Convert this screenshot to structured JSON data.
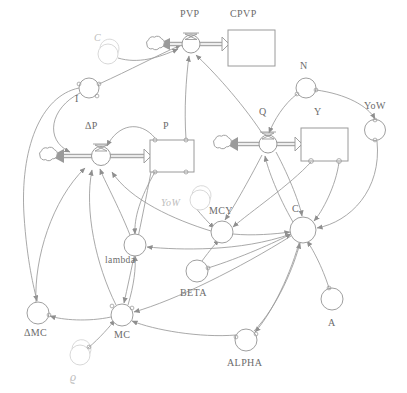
{
  "diagram": {
    "type": "system-dynamics-stock-and-flow",
    "title": "",
    "colors": {
      "line": "#9a9a9a",
      "line_dark": "#8a8a8a",
      "text": "#6b6b6b",
      "ghost": "#c9c9c9",
      "pipe": "#a0a0a0",
      "background": "#ffffff"
    },
    "stocks": [
      {
        "id": "CPVP",
        "label": "CPVP",
        "x": 228,
        "y": 30,
        "w": 47,
        "h": 36,
        "label_x": 232,
        "label_y": 14
      },
      {
        "id": "P",
        "label": "P",
        "x": 150,
        "y": 140,
        "w": 44,
        "h": 32,
        "label_x": 164,
        "label_y": 126
      },
      {
        "id": "Y",
        "label": "Y",
        "x": 301,
        "y": 128,
        "w": 47,
        "h": 33,
        "label_x": 315,
        "label_y": 112
      }
    ],
    "flows": [
      {
        "id": "PVP",
        "label": "PVP",
        "valve_x": 191,
        "valve_y": 44,
        "label_x": 180,
        "label_y": 14,
        "cloud_x": 155,
        "cloud_y": 44,
        "source": "CPVP",
        "direction": "left"
      },
      {
        "id": "DP",
        "label": "ΔP",
        "valve_x": 101,
        "valve_y": 156,
        "label_x": 86,
        "label_y": 126,
        "cloud_x": 48,
        "cloud_y": 155,
        "source": "P",
        "direction": "left"
      },
      {
        "id": "Q",
        "label": "Q",
        "valve_x": 268,
        "valve_y": 144,
        "label_x": 262,
        "label_y": 112,
        "cloud_x": 222,
        "cloud_y": 143,
        "source": "Y",
        "direction": "left"
      }
    ],
    "auxiliaries": [
      {
        "id": "I",
        "label": "I",
        "cx": 89,
        "cy": 88,
        "r": 10,
        "label_x": 78,
        "label_y": 95,
        "ghost": false
      },
      {
        "id": "N",
        "label": "N",
        "cx": 306,
        "cy": 88,
        "r": 10,
        "label_x": 302,
        "label_y": 66,
        "ghost": false
      },
      {
        "id": "YoW_R",
        "label": "YoW",
        "cx": 375,
        "cy": 130,
        "r": 10,
        "label_x": 366,
        "label_y": 105,
        "ghost": false
      },
      {
        "id": "MCY",
        "label": "MCY",
        "cx": 222,
        "cy": 232,
        "r": 11,
        "label_x": 211,
        "label_y": 211,
        "ghost": false
      },
      {
        "id": "C_HUB",
        "label": "C",
        "cx": 303,
        "cy": 230,
        "r": 13,
        "label_x": 293,
        "label_y": 209,
        "ghost": false
      },
      {
        "id": "lambda",
        "label": "lambda",
        "cx": 135,
        "cy": 245,
        "r": 11,
        "label_x": 107,
        "label_y": 262,
        "ghost": false
      },
      {
        "id": "BETA",
        "label": "BETA",
        "cx": 197,
        "cy": 271,
        "r": 11,
        "label_x": 182,
        "label_y": 293,
        "ghost": false
      },
      {
        "id": "A",
        "label": "A",
        "cx": 332,
        "cy": 299,
        "r": 11,
        "label_x": 328,
        "label_y": 323,
        "ghost": false
      },
      {
        "id": "ALPHA",
        "label": "ALPHA",
        "cx": 246,
        "cy": 340,
        "r": 11,
        "label_x": 229,
        "label_y": 363,
        "ghost": false
      },
      {
        "id": "MC",
        "label": "MC",
        "cx": 122,
        "cy": 315,
        "r": 11,
        "label_x": 115,
        "label_y": 337,
        "ghost": false
      },
      {
        "id": "DMC",
        "label": "ΔMC",
        "cx": 38,
        "cy": 313,
        "r": 11,
        "label_x": 26,
        "label_y": 334,
        "ghost": false
      },
      {
        "id": "C_GHOST",
        "label": "C",
        "cx": 108,
        "cy": 54,
        "r": 10,
        "label_x": 96,
        "label_y": 40,
        "ghost": true
      },
      {
        "id": "YoW_M",
        "label": "YoW",
        "cx": 200,
        "cy": 200,
        "r": 10,
        "label_x": 163,
        "label_y": 208,
        "ghost": true
      },
      {
        "id": "rho",
        "label": "ϱ",
        "cx": 80,
        "cy": 355,
        "r": 10,
        "label_x": 70,
        "label_y": 380,
        "ghost": true
      }
    ],
    "clouds": [
      {
        "id": "cloud-pvp",
        "cx": 155,
        "cy": 44
      },
      {
        "id": "cloud-dp",
        "cx": 48,
        "cy": 155
      },
      {
        "id": "cloud-q",
        "cx": 222,
        "cy": 143
      }
    ],
    "connector_count": 34,
    "labels_all": [
      "PVP",
      "CPVP",
      "C",
      "I",
      "ΔP",
      "P",
      "Q",
      "Y",
      "N",
      "YoW",
      "YoW",
      "MCY",
      "C",
      "lambda",
      "BETA",
      "A",
      "ALPHA",
      "MC",
      "ΔMC",
      "ϱ"
    ]
  }
}
